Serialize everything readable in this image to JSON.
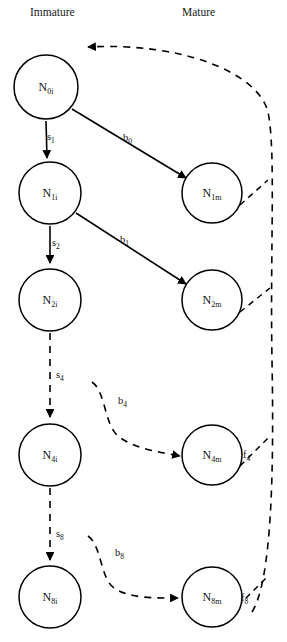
{
  "figure": {
    "type": "flow-diagram",
    "title": ""
  },
  "columns": [
    {
      "id": "immature",
      "label": "Immature",
      "x": 30,
      "y": 16
    },
    {
      "id": "mature",
      "label": "Mature",
      "x": 182,
      "y": 16
    }
  ],
  "nodes": [
    {
      "id": "n0i",
      "base": "N",
      "sub": "0i",
      "cx": 46,
      "cy": 87,
      "r": 32,
      "column": "immature"
    },
    {
      "id": "n1i",
      "base": "N",
      "sub": "1i",
      "cx": 50,
      "cy": 193,
      "r": 31,
      "column": "immature"
    },
    {
      "id": "n2i",
      "base": "N",
      "sub": "2i",
      "cx": 50,
      "cy": 300,
      "r": 31,
      "column": "immature"
    },
    {
      "id": "n4i",
      "base": "N",
      "sub": "4i",
      "cx": 50,
      "cy": 455,
      "r": 31,
      "column": "immature"
    },
    {
      "id": "n8i",
      "base": "N",
      "sub": "8i",
      "cx": 50,
      "cy": 597,
      "r": 31,
      "column": "immature"
    },
    {
      "id": "n1m",
      "base": "N",
      "sub": "1m",
      "cx": 212,
      "cy": 193,
      "r": 30,
      "column": "mature"
    },
    {
      "id": "n2m",
      "base": "N",
      "sub": "2m",
      "cx": 212,
      "cy": 300,
      "r": 30,
      "column": "mature"
    },
    {
      "id": "n4m",
      "base": "N",
      "sub": "4m",
      "cx": 212,
      "cy": 455,
      "r": 30,
      "column": "mature"
    },
    {
      "id": "n8m",
      "base": "N",
      "sub": "8m",
      "cx": 212,
      "cy": 597,
      "r": 30,
      "column": "mature"
    }
  ],
  "edges": [
    {
      "id": "s1",
      "base": "s",
      "sub": "1",
      "from": "n0i",
      "to": "n1i",
      "style": "solid",
      "label_x": 47,
      "label_y": 140
    },
    {
      "id": "s2",
      "base": "s",
      "sub": "2",
      "from": "n1i",
      "to": "n2i",
      "style": "solid",
      "label_x": 52,
      "label_y": 246
    },
    {
      "id": "s4",
      "base": "s",
      "sub": "4",
      "from": "n2i",
      "to": "n4i",
      "style": "dashed",
      "label_x": 56,
      "label_y": 378
    },
    {
      "id": "s8",
      "base": "s",
      "sub": "8",
      "from": "n4i",
      "to": "n8i",
      "style": "dashed",
      "label_x": 56,
      "label_y": 537
    },
    {
      "id": "b0",
      "base": "b",
      "sub": "0",
      "from": "n0i",
      "to": "n1m",
      "style": "solid",
      "label_x": 123,
      "label_y": 141
    },
    {
      "id": "b1",
      "base": "b",
      "sub": "1",
      "from": "n1i",
      "to": "n2m",
      "style": "solid",
      "label_x": 120,
      "label_y": 243
    },
    {
      "id": "b4",
      "base": "b",
      "sub": "4",
      "from": "n2i",
      "to": "n4m",
      "style": "dashed",
      "label_x": 118,
      "label_y": 404
    },
    {
      "id": "b8",
      "base": "b",
      "sub": "8",
      "from": "n4i",
      "to": "n8m",
      "style": "dashed",
      "label_x": 115,
      "label_y": 556
    },
    {
      "id": "f1",
      "base": "f",
      "sub": "1",
      "from": "n1m",
      "to": "n0i",
      "style": "dashed",
      "label_x": null,
      "label_y": null
    },
    {
      "id": "f2",
      "base": "f",
      "sub": "2",
      "from": "n2m",
      "to": "n0i",
      "style": "dashed",
      "label_x": null,
      "label_y": null
    },
    {
      "id": "f4",
      "base": "f",
      "sub": "4",
      "from": "n4m",
      "to": "n0i",
      "style": "dashed",
      "label_x": 243,
      "label_y": 458
    },
    {
      "id": "f8",
      "base": "f",
      "sub": "8",
      "from": "n8m",
      "to": "n0i",
      "style": "dashed",
      "label_x": 241,
      "label_y": 601
    }
  ],
  "colors": {
    "stroke": "#000000",
    "fill": "#ffffff",
    "text": "#111111"
  }
}
